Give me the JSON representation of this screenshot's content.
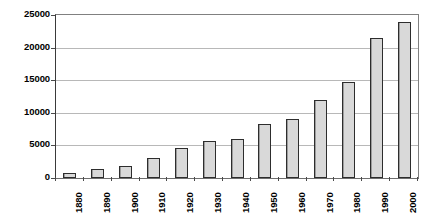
{
  "chart_data": {
    "type": "bar",
    "title": "",
    "xlabel": "",
    "ylabel": "",
    "categories": [
      "1880",
      "1890",
      "1900",
      "1910",
      "1920",
      "1930",
      "1940",
      "1950",
      "1960",
      "1970",
      "1980",
      "1990",
      "2000"
    ],
    "values": [
      800,
      1350,
      1850,
      3050,
      4600,
      5700,
      6050,
      8300,
      9050,
      11900,
      14700,
      21500,
      23900
    ],
    "ylim": [
      0,
      25000
    ],
    "y_ticks": [
      0,
      5000,
      10000,
      15000,
      20000,
      25000
    ],
    "y_tick_labels": [
      "0",
      "5000",
      "10000",
      "15000",
      "20000",
      "25000"
    ],
    "grid": true,
    "legend": false,
    "legend_position": "none",
    "orientation": "vertical",
    "x_label_rotation": -90,
    "bar_fill_color": "#D9D9D9",
    "bar_border_color": "#2D2D2D",
    "gridline_color": "#B8B8B8",
    "axis_color": "#3A3A3A",
    "background_color": "#FFFFFF"
  }
}
